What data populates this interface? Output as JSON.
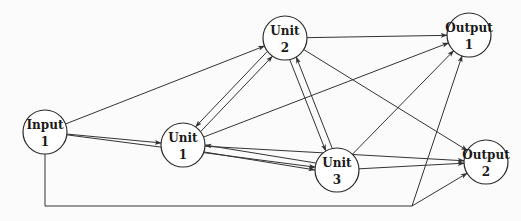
{
  "diagram": {
    "type": "directed-network",
    "nodes": [
      {
        "id": "input1",
        "line1": "Input",
        "line2": "1"
      },
      {
        "id": "unit1",
        "line1": "Unit",
        "line2": "1"
      },
      {
        "id": "unit2",
        "line1": "Unit",
        "line2": "2"
      },
      {
        "id": "unit3",
        "line1": "Unit",
        "line2": "3"
      },
      {
        "id": "output1",
        "line1": "Output",
        "line2": "1"
      },
      {
        "id": "output2",
        "line1": "Output",
        "line2": "2"
      }
    ],
    "edges": [
      {
        "from": "input1",
        "to": "unit1"
      },
      {
        "from": "input1",
        "to": "unit2"
      },
      {
        "from": "input1",
        "to": "unit3"
      },
      {
        "from": "input1",
        "to": "output1",
        "routed": "bottom"
      },
      {
        "from": "input1",
        "to": "output2",
        "routed": "bottom"
      },
      {
        "from": "unit1",
        "to": "unit2"
      },
      {
        "from": "unit2",
        "to": "unit1"
      },
      {
        "from": "unit1",
        "to": "unit3"
      },
      {
        "from": "unit3",
        "to": "unit1"
      },
      {
        "from": "unit2",
        "to": "unit3"
      },
      {
        "from": "unit3",
        "to": "unit2"
      },
      {
        "from": "unit1",
        "to": "output1"
      },
      {
        "from": "unit1",
        "to": "output2"
      },
      {
        "from": "unit2",
        "to": "output1"
      },
      {
        "from": "unit2",
        "to": "output2"
      },
      {
        "from": "unit3",
        "to": "output1"
      },
      {
        "from": "unit3",
        "to": "output2"
      }
    ]
  }
}
